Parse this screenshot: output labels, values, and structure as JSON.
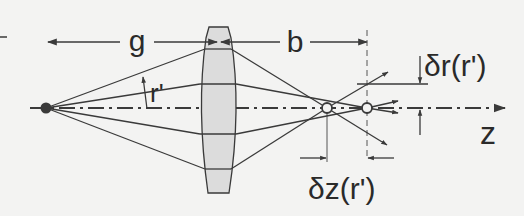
{
  "diagram": {
    "labels": {
      "object_distance": "g",
      "image_distance": "b",
      "ray_height": "r'",
      "radial_deviation": "δr(r')",
      "axial_deviation": "δz(r')",
      "optical_axis": "z"
    },
    "colors": {
      "background": "#f3f3f2",
      "stroke": "#3a3a3a",
      "lens_fill": "#dcdcdc",
      "text": "#2a2a2a"
    }
  }
}
